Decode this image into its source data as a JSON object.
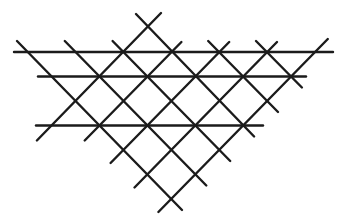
{
  "figure": {
    "background_color": "#ffffff",
    "stroke_color": "#1b1b1b",
    "stroke_width": 2.4,
    "canvas": {
      "width": 345,
      "height": 224
    },
    "lines": [
      {
        "name": "horizontal-line-top",
        "x1": 14,
        "y1": 52,
        "x2": 333,
        "y2": 52
      },
      {
        "name": "horizontal-line-middle",
        "x1": 38,
        "y1": 76.5,
        "x2": 306,
        "y2": 76.5
      },
      {
        "name": "horizontal-line-lower",
        "x1": 36,
        "y1": 125.5,
        "x2": 263,
        "y2": 125.5
      },
      {
        "name": "backslash-diagonal-1",
        "x1": 17,
        "y1": 41,
        "x2": 182,
        "y2": 210
      },
      {
        "name": "backslash-diagonal-2",
        "x1": 64.8,
        "y1": 41,
        "x2": 206.3,
        "y2": 185.5
      },
      {
        "name": "backslash-diagonal-3",
        "x1": 112.6,
        "y1": 41,
        "x2": 230.2,
        "y2": 161
      },
      {
        "name": "backslash-diagonal-4",
        "x1": 136,
        "y1": 14,
        "x2": 254.1,
        "y2": 136.5
      },
      {
        "name": "backslash-diagonal-5",
        "x1": 208.2,
        "y1": 41,
        "x2": 278,
        "y2": 112
      },
      {
        "name": "backslash-diagonal-6",
        "x1": 256,
        "y1": 41,
        "x2": 301.9,
        "y2": 87.5
      },
      {
        "name": "slash-diagonal-1",
        "x1": 36.9,
        "y1": 140.5,
        "x2": 161,
        "y2": 13
      },
      {
        "name": "slash-diagonal-2",
        "x1": 84.7,
        "y1": 140.5,
        "x2": 181.4,
        "y2": 42
      },
      {
        "name": "slash-diagonal-3",
        "x1": 110.6,
        "y1": 163,
        "x2": 229.2,
        "y2": 42
      },
      {
        "name": "slash-diagonal-4",
        "x1": 134.5,
        "y1": 187.5,
        "x2": 277,
        "y2": 42
      },
      {
        "name": "slash-diagonal-5",
        "x1": 158.4,
        "y1": 212,
        "x2": 327.8,
        "y2": 39
      }
    ]
  }
}
